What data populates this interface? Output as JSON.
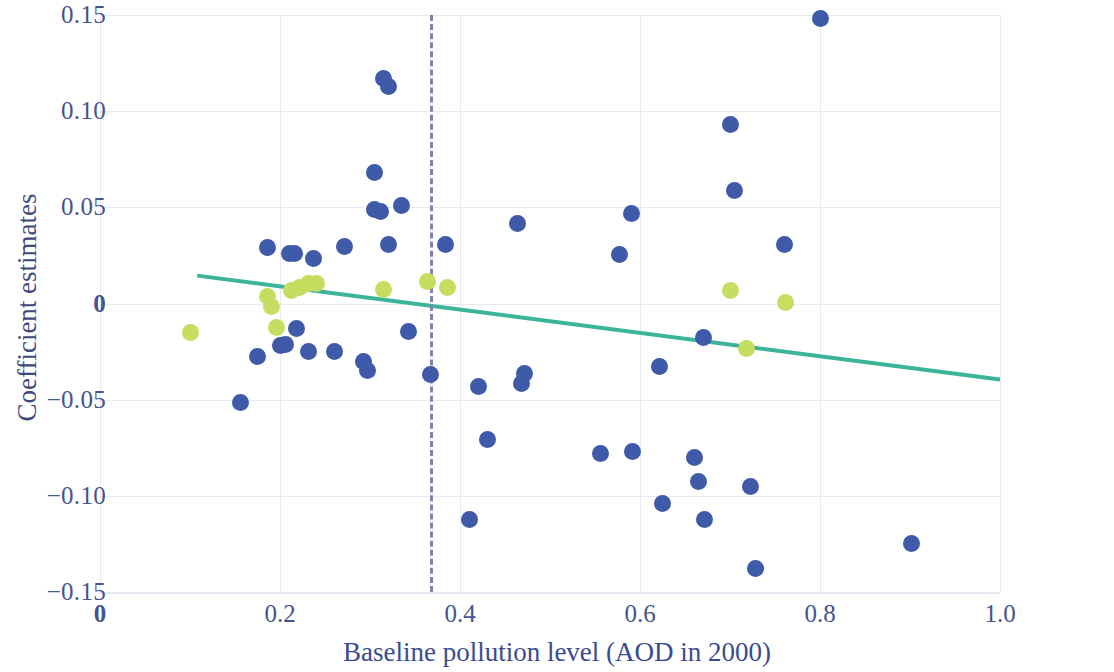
{
  "chart_data": {
    "type": "scatter",
    "title": "",
    "xlabel": "Baseline pollution level (AOD in 2000)",
    "ylabel": "Coefficient estimates",
    "xlim": [
      0,
      1.0
    ],
    "ylim": [
      -0.15,
      0.15
    ],
    "xticks": [
      "0",
      "0.2",
      "0.4",
      "0.6",
      "0.8",
      "1.0"
    ],
    "xtick_values": [
      0,
      0.2,
      0.4,
      0.6,
      0.8,
      1.0
    ],
    "yticks": [
      "0.15",
      "0.10",
      "0.05",
      "0",
      "-0.05",
      "-0.10",
      "-0.15"
    ],
    "ytick_values": [
      0.15,
      0.1,
      0.05,
      0,
      -0.05,
      -0.1,
      -0.15
    ],
    "grid": true,
    "legend": "none",
    "colors": {
      "series_blue": "#3f5aa8",
      "series_green": "#c5de5f",
      "trendline": "#3cb49a",
      "reference_line": "#8084ad",
      "axis_text": "#44548c",
      "axis_title": "#3a4c8f",
      "gridline": "#e9e9f2"
    },
    "series": [
      {
        "name": "blue-points",
        "color": "#3f5aa8",
        "points": [
          [
            0.156,
            -0.0515
          ],
          [
            0.175,
            -0.0275
          ],
          [
            0.186,
            0.029
          ],
          [
            0.2,
            -0.022
          ],
          [
            0.206,
            -0.0215
          ],
          [
            0.211,
            0.0258
          ],
          [
            0.216,
            0.0258
          ],
          [
            0.218,
            -0.013
          ],
          [
            0.232,
            -0.025
          ],
          [
            0.237,
            0.0235
          ],
          [
            0.26,
            -0.025
          ],
          [
            0.272,
            0.0295
          ],
          [
            0.293,
            -0.03
          ],
          [
            0.297,
            -0.0348
          ],
          [
            0.305,
            0.068
          ],
          [
            0.305,
            0.049
          ],
          [
            0.312,
            0.0478
          ],
          [
            0.315,
            0.117
          ],
          [
            0.32,
            0.1128
          ],
          [
            0.321,
            0.0305
          ],
          [
            0.335,
            0.0508
          ],
          [
            0.343,
            -0.0148
          ],
          [
            0.367,
            -0.0368
          ],
          [
            0.384,
            0.0305
          ],
          [
            0.41,
            -0.1122
          ],
          [
            0.42,
            -0.0432
          ],
          [
            0.431,
            -0.0705
          ],
          [
            0.464,
            0.0415
          ],
          [
            0.468,
            -0.0415
          ],
          [
            0.472,
            -0.0362
          ],
          [
            0.556,
            -0.0782
          ],
          [
            0.577,
            0.0255
          ],
          [
            0.59,
            0.0468
          ],
          [
            0.592,
            -0.0768
          ],
          [
            0.622,
            -0.033
          ],
          [
            0.625,
            -0.1038
          ],
          [
            0.66,
            -0.08
          ],
          [
            0.665,
            -0.0925
          ],
          [
            0.67,
            -0.0178
          ],
          [
            0.672,
            -0.1122
          ],
          [
            0.7,
            0.093
          ],
          [
            0.705,
            0.0585
          ],
          [
            0.723,
            -0.0952
          ],
          [
            0.728,
            -0.1378
          ],
          [
            0.76,
            0.0305
          ],
          [
            0.8,
            0.148
          ],
          [
            0.902,
            -0.1248
          ]
        ]
      },
      {
        "name": "green-points",
        "color": "#c5de5f",
        "points": [
          [
            0.1,
            -0.0152
          ],
          [
            0.186,
            0.0035
          ],
          [
            0.19,
            -0.0015
          ],
          [
            0.196,
            -0.0125
          ],
          [
            0.213,
            0.007
          ],
          [
            0.222,
            0.0082
          ],
          [
            0.232,
            0.0105
          ],
          [
            0.24,
            0.0105
          ],
          [
            0.315,
            0.0072
          ],
          [
            0.364,
            0.0115
          ],
          [
            0.386,
            0.0082
          ],
          [
            0.7,
            0.0068
          ],
          [
            0.718,
            -0.0232
          ],
          [
            0.762,
            0.0005
          ]
        ]
      }
    ],
    "trendline": {
      "name": "fitted-regression-line",
      "x_start": 0.108,
      "y_start": 0.0145,
      "x_end": 1.0,
      "y_end": -0.0395,
      "color": "#3cb49a",
      "width": 4
    },
    "reference_line": {
      "name": "vertical-threshold",
      "orientation": "vertical",
      "x": 0.367,
      "style": "dashed",
      "color": "#8084ad"
    },
    "annotations": []
  }
}
